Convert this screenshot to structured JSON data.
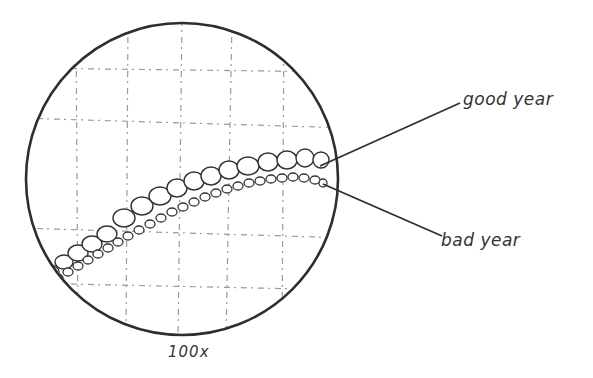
{
  "diagram": {
    "labels": {
      "good_year": "good year",
      "bad_year": "bad year",
      "magnification": "100x"
    },
    "colors": {
      "ink": "#333333",
      "grid": "#9a9a9a",
      "background": "#ffffff"
    }
  }
}
